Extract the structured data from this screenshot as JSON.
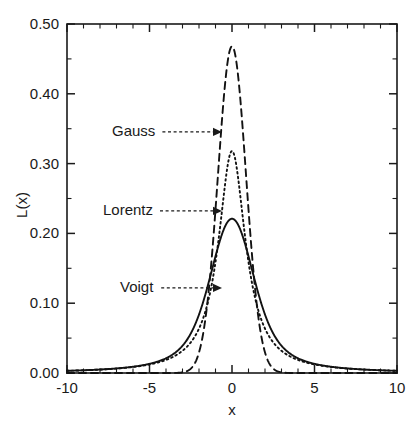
{
  "chart_data": {
    "type": "line",
    "title": "",
    "subtitle": "",
    "xlabel": "x",
    "ylabel": "L(x)",
    "xlim": [
      -10,
      10
    ],
    "ylim": [
      0.0,
      0.5
    ],
    "grid": false,
    "legend_position": "inline-annotations",
    "x_ticks": [
      "-10",
      "-5",
      "0",
      "5",
      "10"
    ],
    "x_tick_values": [
      -10,
      -5,
      0,
      5,
      10
    ],
    "x_minor_tick_step": 1,
    "y_ticks": [
      "0.00",
      "0.10",
      "0.20",
      "0.30",
      "0.40",
      "0.50"
    ],
    "y_tick_values": [
      0.0,
      0.1,
      0.2,
      0.3,
      0.4,
      0.5
    ],
    "y_minor_tick_step": 0.05,
    "annotations": [
      {
        "label": "Gauss",
        "target_x": 0.0,
        "target_y": 0.35,
        "style": "dashed-arrow"
      },
      {
        "label": "Lorentz",
        "target_x": 0.0,
        "target_y": 0.24,
        "style": "dashed-arrow"
      },
      {
        "label": "Voigt",
        "target_x": 0.0,
        "target_y": 0.135,
        "style": "dashed-arrow"
      }
    ],
    "series": [
      {
        "name": "Gauss",
        "line_style": "dashed",
        "peak_value": 0.468,
        "peak_x": 0.0,
        "x": [
          -10,
          -9.5,
          -9,
          -8.5,
          -8,
          -7.5,
          -7,
          -6.5,
          -6,
          -5.5,
          -5,
          -4.5,
          -4,
          -3.75,
          -3.5,
          -3.25,
          -3,
          -2.75,
          -2.5,
          -2.25,
          -2,
          -1.75,
          -1.5,
          -1.25,
          -1,
          -0.75,
          -0.5,
          -0.25,
          0,
          0.25,
          0.5,
          0.75,
          1,
          1.25,
          1.5,
          1.75,
          2,
          2.25,
          2.5,
          2.75,
          3,
          3.25,
          3.5,
          3.75,
          4,
          4.5,
          5,
          5.5,
          6,
          6.5,
          7,
          7.5,
          8,
          8.5,
          9,
          9.5,
          10
        ],
        "values": [
          0,
          0,
          0,
          0,
          0,
          0,
          0,
          0,
          0,
          1.2e-06,
          9.7e-06,
          6.09e-05,
          0.0003,
          0.00061,
          0.00118,
          0.00217,
          0.00382,
          0.00644,
          0.01041,
          0.01613,
          0.02398,
          0.03424,
          0.04698,
          0.06192,
          0.07838,
          0.09529,
          0.11135,
          0.12516,
          0.13545,
          0.12516,
          0.11135,
          0.09529,
          0.07838,
          0.06192,
          0.04698,
          0.03424,
          0.02398,
          0.01613,
          0.01041,
          0.00644,
          0.00382,
          0.00217,
          0.00118,
          0.00061,
          0.0003,
          6.09e-05,
          9.7e-06,
          1.2e-06,
          0,
          0,
          0,
          0,
          0,
          0,
          0,
          0,
          0
        ],
        "sigma": 0.85,
        "fwhm": 2.0
      },
      {
        "name": "Lorentz",
        "line_style": "dotted",
        "peak_value": 0.318,
        "peak_x": 0.0,
        "gamma": 1.0,
        "fwhm": 2.0
      },
      {
        "name": "Voigt",
        "line_style": "solid",
        "peak_value": 0.221,
        "peak_x": 0.0,
        "sigma": 0.85,
        "gamma": 1.0
      }
    ]
  },
  "figure": {
    "background_color": "#ffffff",
    "line_color": "#121212",
    "axis_color": "#1a1a1a"
  }
}
